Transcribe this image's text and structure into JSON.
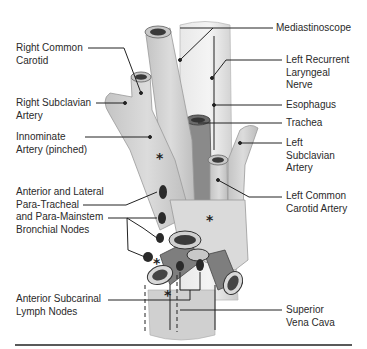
{
  "figure": {
    "labels": {
      "right_common_carotid": [
        "Right Common",
        "Carotid"
      ],
      "right_subclavian": [
        "Right Subclavian",
        "Artery"
      ],
      "innominate": [
        "Innominate",
        "Artery (pinched)"
      ],
      "paratracheal": [
        "Anterior and Lateral",
        "Para-Tracheal",
        "and Para-Mainstem",
        "Bronchial Nodes"
      ],
      "subcarinal": [
        "Anterior Subcarinal",
        "Lymph Nodes"
      ],
      "mediastinoscope": [
        "Mediastinoscope"
      ],
      "left_recurrent": [
        "Left Recurrent",
        "Laryngeal",
        "Nerve"
      ],
      "esophagus": [
        "Esophagus"
      ],
      "trachea": [
        "Trachea"
      ],
      "left_subclavian": [
        "Left",
        "Subclavian",
        "Artery"
      ],
      "left_common_carotid": [
        "Left Common",
        "Carotid Artery"
      ],
      "svc": [
        "Superior",
        "Vena Cava"
      ]
    },
    "markers": {
      "asterisk": "*"
    },
    "colors": {
      "vessel_fill": "#d4d4d4",
      "vessel_shade": "#b8b8b8",
      "trachea_fill": "#8a8a8a",
      "node_fill": "#2a2a2a",
      "line": "#222222"
    }
  }
}
